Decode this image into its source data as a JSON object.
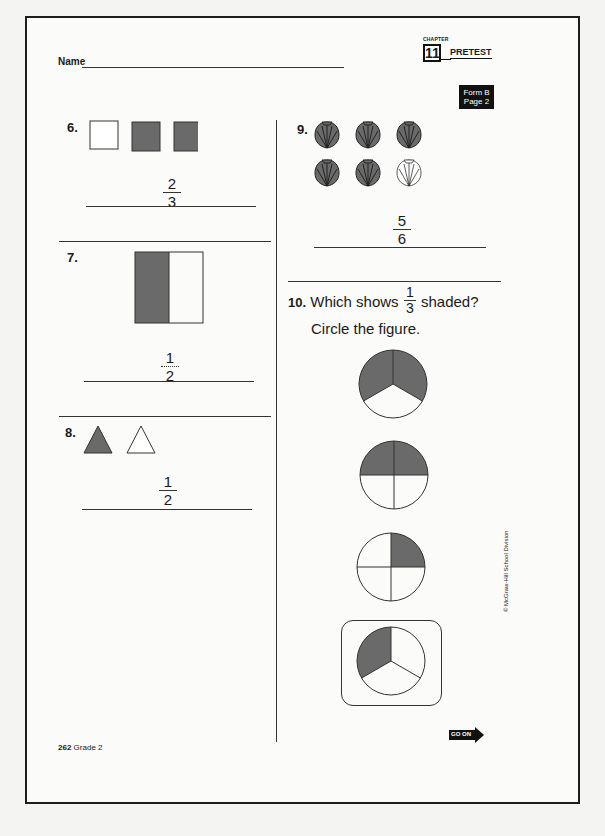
{
  "header": {
    "name_label": "Name",
    "chapter_label": "CHAPTER",
    "chapter_number": "11",
    "test_type": "PRETEST",
    "form_line1": "Form B",
    "form_line2": "Page 2"
  },
  "questions": {
    "q6": {
      "number": "6.",
      "figures": [
        "square-unshaded",
        "square-shaded",
        "square-shaded"
      ],
      "answer": {
        "numerator": "2",
        "denominator": "3"
      }
    },
    "q7": {
      "number": "7.",
      "figures": [
        "rectangle-half-shaded"
      ],
      "answer": {
        "numerator": "1",
        "denominator": "2"
      }
    },
    "q8": {
      "number": "8.",
      "figures": [
        "triangle-shaded",
        "triangle-unshaded"
      ],
      "answer": {
        "numerator": "1",
        "denominator": "2"
      }
    },
    "q9": {
      "number": "9.",
      "figures": [
        "shell-shaded",
        "shell-shaded",
        "shell-shaded",
        "shell-shaded",
        "shell-shaded",
        "shell-unshaded"
      ],
      "answer": {
        "numerator": "5",
        "denominator": "6"
      }
    },
    "q10": {
      "number": "10.",
      "prompt_before": "Which shows",
      "prompt_numerator": "1",
      "prompt_denominator": "3",
      "prompt_after": "shaded?",
      "instruction": "Circle the figure.",
      "options": [
        {
          "id": "a",
          "desc": "circle in thirds, 2 of 3 shaded",
          "circled": false
        },
        {
          "id": "b",
          "desc": "circle in fourths, 2 of 4 shaded",
          "circled": false
        },
        {
          "id": "c",
          "desc": "circle in fourths, 1 of 4 shaded",
          "circled": false
        },
        {
          "id": "d",
          "desc": "circle in thirds, 1 of 3 shaded",
          "circled": true
        }
      ]
    }
  },
  "footer": {
    "page_number": "262",
    "grade": "Grade 2",
    "go_on": "GO ON",
    "copyright": "© McGraw-Hill School Division"
  }
}
